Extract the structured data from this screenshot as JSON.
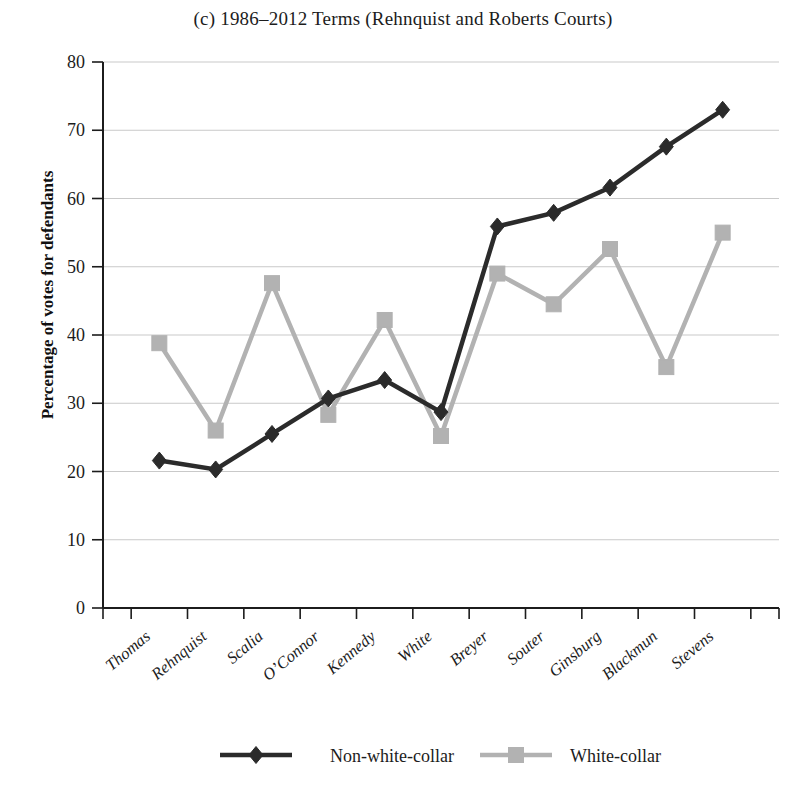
{
  "chart_data": {
    "type": "line",
    "title": "(c) 1986–2012 Terms (Rehnquist and Roberts Courts)",
    "xlabel": "",
    "ylabel": "Percentage of votes for defendants",
    "ylim": [
      0,
      80
    ],
    "ytick_values": [
      0,
      10,
      20,
      30,
      40,
      50,
      60,
      70,
      80
    ],
    "ytick_labels": [
      "0",
      "10",
      "20",
      "30",
      "40",
      "50",
      "60",
      "70",
      "80"
    ],
    "grid": true,
    "legend_position": "bottom",
    "categories": [
      "Thomas",
      "Rehnquist",
      "Scalia",
      "O’Connor",
      "Kennedy",
      "White",
      "Breyer",
      "Souter",
      "Ginsburg",
      "Blackmun",
      "Stevens"
    ],
    "series": [
      {
        "name": "Non-white-collar",
        "color": "#2b2b2b",
        "marker": "diamond",
        "values": [
          21.6,
          20.3,
          25.5,
          30.7,
          33.4,
          28.7,
          55.9,
          57.9,
          61.6,
          67.6,
          73.0
        ]
      },
      {
        "name": "White-collar",
        "color": "#b2b2b2",
        "marker": "square",
        "values": [
          38.8,
          26.0,
          47.6,
          28.3,
          42.2,
          25.2,
          49.0,
          44.5,
          52.6,
          35.3,
          55.0
        ]
      }
    ]
  },
  "legend": {
    "entries": [
      {
        "label": "Non-white-collar",
        "color": "#2b2b2b",
        "marker": "diamond"
      },
      {
        "label": "White-collar",
        "color": "#b2b2b2",
        "marker": "square"
      }
    ]
  }
}
